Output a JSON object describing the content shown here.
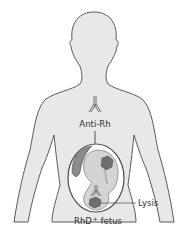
{
  "diagram": {
    "labels": {
      "antibody": "Anti-Rh",
      "lysis": "Lysis",
      "fetus_main": "RhD",
      "fetus_sup": "+",
      "fetus_tail": " fetus"
    },
    "colors": {
      "body_fill": "#e8e8e8",
      "outline": "#4a4a4a",
      "fetus_dark": "#8a8a8a",
      "fetus_light": "#d4d4d4",
      "cell": "#6e6e6e",
      "uterus_fill": "#ffffff"
    }
  }
}
